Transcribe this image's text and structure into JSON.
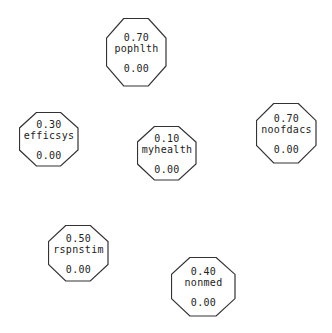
{
  "diagram": {
    "type": "network-nodes",
    "stroke_color": "#333333",
    "nodes": [
      {
        "id": "pophlth",
        "name": "pophlth",
        "value": "0.70",
        "base": "0.00",
        "x": 106,
        "y": 18,
        "w": 61,
        "h": 69
      },
      {
        "id": "efficsys",
        "name": "efficsys",
        "value": "0.30",
        "base": "0.00",
        "x": 19,
        "y": 112,
        "w": 60,
        "h": 55
      },
      {
        "id": "myhealth",
        "name": "myhealth",
        "value": "0.10",
        "base": "0.00",
        "x": 137,
        "y": 126,
        "w": 60,
        "h": 55
      },
      {
        "id": "noofdacs",
        "name": "noofdacs",
        "value": "0.70",
        "base": "0.00",
        "x": 256,
        "y": 103,
        "w": 61,
        "h": 61
      },
      {
        "id": "rspnstim",
        "name": "rspnstim",
        "value": "0.50",
        "base": "0.00",
        "x": 48,
        "y": 225,
        "w": 61,
        "h": 57
      },
      {
        "id": "nonmed",
        "name": "nonmed",
        "value": "0.40",
        "base": "0.00",
        "x": 171,
        "y": 257,
        "w": 65,
        "h": 60
      }
    ]
  }
}
